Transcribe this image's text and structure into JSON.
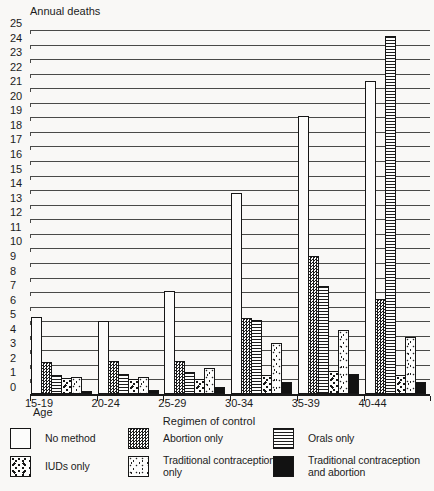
{
  "chart_data": {
    "type": "bar",
    "title": "",
    "ylabel": "Annual deaths",
    "xlabel": "Age",
    "x_title": "Regimen of control",
    "ylim": [
      0,
      25
    ],
    "ytick_step": 1,
    "grid": true,
    "legend_position": "bottom",
    "categories": [
      "15-19",
      "20-24",
      "25-29",
      "30-34",
      "35-39",
      "40-44"
    ],
    "series": [
      {
        "name": "No method",
        "pattern": "no-method",
        "values": [
          5.3,
          5.0,
          7.1,
          13.8,
          19.1,
          21.5
        ]
      },
      {
        "name": "Abortion only",
        "pattern": "abortion",
        "values": [
          2.2,
          2.3,
          2.3,
          5.2,
          9.5,
          6.5
        ]
      },
      {
        "name": "Orals only",
        "pattern": "orals",
        "values": [
          1.3,
          1.4,
          1.5,
          5.1,
          7.4,
          24.6
        ]
      },
      {
        "name": "IUDs only",
        "pattern": "iuds",
        "values": [
          1.1,
          1.0,
          1.0,
          1.3,
          1.6,
          1.3
        ]
      },
      {
        "name": "Traditional contraception only",
        "pattern": "trad",
        "values": [
          1.2,
          1.2,
          1.8,
          3.5,
          4.4,
          3.9
        ]
      },
      {
        "name": "Traditional contraception and abortion",
        "pattern": "trad-abortion",
        "values": [
          0.2,
          0.3,
          0.5,
          0.8,
          1.4,
          0.8
        ]
      }
    ]
  },
  "legend": {
    "items": [
      {
        "label": "No method",
        "pattern": "no-method"
      },
      {
        "label": "Abortion only",
        "pattern": "abortion"
      },
      {
        "label": "Orals only",
        "pattern": "orals"
      },
      {
        "label": "IUDs only",
        "pattern": "iuds"
      },
      {
        "label": "Traditional contraception only",
        "pattern": "trad"
      },
      {
        "label": "Traditional contraception and abortion",
        "pattern": "trad-abortion"
      }
    ]
  },
  "colors": {
    "ink": "#1c1c1c",
    "paper": "#f9f8f6",
    "gridline": "#4a4a48"
  }
}
